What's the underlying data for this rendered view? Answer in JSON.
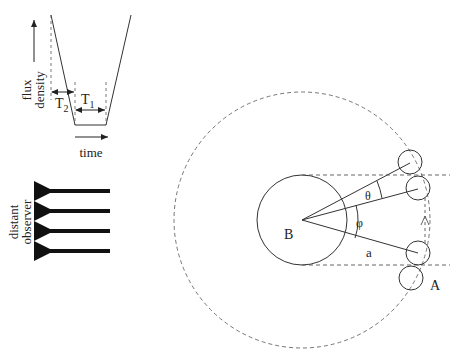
{
  "light_curve": {
    "ylabel_line1": "flux",
    "ylabel_line2": "density",
    "xlabel": "time",
    "t2_label": "T",
    "t2_sub": "2",
    "t1_label": "T",
    "t1_sub": "1"
  },
  "observer": {
    "label_line1": "distant",
    "label_line2": "observer",
    "arrow_count": 4
  },
  "orbit": {
    "primary_label": "B",
    "secondary_label": "A",
    "angle_theta": "θ",
    "angle_phi": "φ",
    "separation_label": "a"
  },
  "colors": {
    "line": "#333333",
    "dashed": "#555555",
    "arrow": "#111111"
  }
}
